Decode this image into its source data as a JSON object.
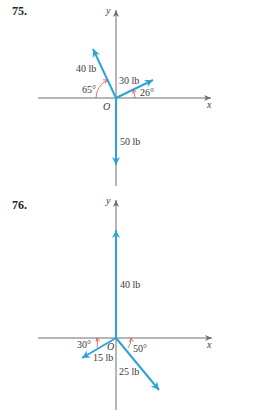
{
  "colors": {
    "vector": "#2ea3d6",
    "axis": "#6d6e71",
    "angle_arc": "#d9534f",
    "text": "#3a3a3a"
  },
  "problems": [
    {
      "number": "75.",
      "axes": {
        "x_label": "x",
        "y_label": "y",
        "origin_label": "O"
      },
      "vectors": [
        {
          "label": "40 lb",
          "angle_label": "65°",
          "description": "pointing up-left, 65° above negative x-axis"
        },
        {
          "label": "30 lb",
          "angle_label": "26°",
          "description": "pointing up-right, 26° above positive x-axis"
        },
        {
          "label": "50 lb",
          "angle_label": "",
          "description": "pointing straight down"
        }
      ]
    },
    {
      "number": "76.",
      "axes": {
        "x_label": "x",
        "y_label": "y",
        "origin_label": "O"
      },
      "vectors": [
        {
          "label": "40 lb",
          "angle_label": "",
          "description": "pointing straight up"
        },
        {
          "label": "15 lb",
          "angle_label": "30°",
          "description": "pointing down-left, 30° below negative x-axis"
        },
        {
          "label": "25 lb",
          "angle_label": "50°",
          "description": "pointing down-right, 50° below positive x-axis"
        }
      ]
    }
  ]
}
